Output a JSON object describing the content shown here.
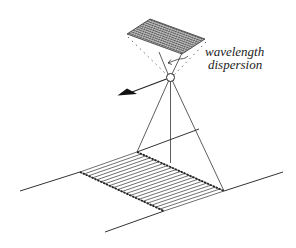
{
  "figure": {
    "labels": {
      "line1": "wavelength",
      "line2": "dispersion"
    },
    "ground_stripes": 20,
    "grating_lines": 24,
    "stroke_color": "#222222"
  }
}
